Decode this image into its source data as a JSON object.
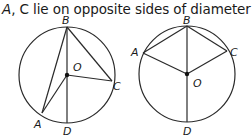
{
  "caption": {
    "part1": "A",
    "part2": ", C lie on opposite sides of diameter ",
    "part3": "BD",
    "part4": "."
  },
  "figures": [
    {
      "name": "left-circle",
      "center": {
        "label": "O",
        "x": 67,
        "y": 75
      },
      "radius": 48,
      "points": {
        "B": {
          "x": 67,
          "y": 27
        },
        "D": {
          "x": 67,
          "y": 123
        },
        "A": {
          "x": 42,
          "y": 113
        },
        "C": {
          "x": 112,
          "y": 81
        }
      },
      "segments": [
        "BD",
        "BA",
        "BC",
        "OA",
        "OC"
      ],
      "labels": {
        "B": "B",
        "O": "O",
        "C": "C",
        "A": "A",
        "D": "D"
      }
    },
    {
      "name": "right-circle",
      "center": {
        "label": "O",
        "x": 187,
        "y": 74
      },
      "radius": 48,
      "points": {
        "B": {
          "x": 187,
          "y": 26
        },
        "D": {
          "x": 187,
          "y": 122
        },
        "A": {
          "x": 143,
          "y": 53
        },
        "C": {
          "x": 227,
          "y": 51
        }
      },
      "segments": [
        "BD",
        "BA",
        "BC",
        "OA",
        "OC"
      ],
      "labels": {
        "B": "B",
        "O": "O",
        "C": "C",
        "A": "A",
        "D": "D"
      }
    }
  ]
}
